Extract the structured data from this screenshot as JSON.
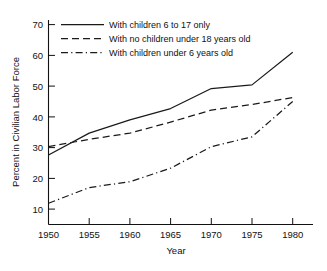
{
  "chart_data": {
    "type": "line",
    "title": "",
    "xlabel": "Year",
    "ylabel": "Percent in Civilian Labor Force",
    "x": [
      1950,
      1955,
      1960,
      1965,
      1970,
      1975,
      1980
    ],
    "xlim": [
      1950,
      1980
    ],
    "ylim": [
      0,
      73
    ],
    "xticks": [
      1950,
      1955,
      1960,
      1965,
      1970,
      1975,
      1980
    ],
    "yticks": [
      10,
      20,
      30,
      40,
      50,
      60,
      70
    ],
    "xtick_labels": [
      "1950",
      "1955",
      "1960",
      "1965",
      "1970",
      "1975",
      "1980"
    ],
    "ytick_labels": [
      "10",
      "20",
      "30",
      "40",
      "50",
      "60",
      "70"
    ],
    "grid": false,
    "legend_position": "upper-left-inside",
    "series": [
      {
        "name": "With children 6 to 17 only",
        "style": "solid",
        "values": [
          27.6,
          34.7,
          39.0,
          42.7,
          49.2,
          50.4,
          61.0
        ]
      },
      {
        "name": "With no children under 18 years old",
        "style": "dashed",
        "values": [
          30.3,
          32.7,
          34.7,
          38.3,
          42.2,
          44.0,
          46.3
        ]
      },
      {
        "name": "With children under 6 years old",
        "style": "dash-dot",
        "values": [
          11.9,
          17.0,
          18.9,
          23.3,
          30.3,
          33.5,
          45.0
        ]
      }
    ]
  },
  "legend": {
    "items": [
      {
        "label": "With children 6 to 17 only",
        "style": "solid"
      },
      {
        "label": "With no children under 18 years old",
        "style": "dashed"
      },
      {
        "label": "With children under 6 years old",
        "style": "dash-dot"
      }
    ]
  },
  "axes": {
    "y_title": "Percent in Civilian Labor Force",
    "x_title": "Year"
  }
}
